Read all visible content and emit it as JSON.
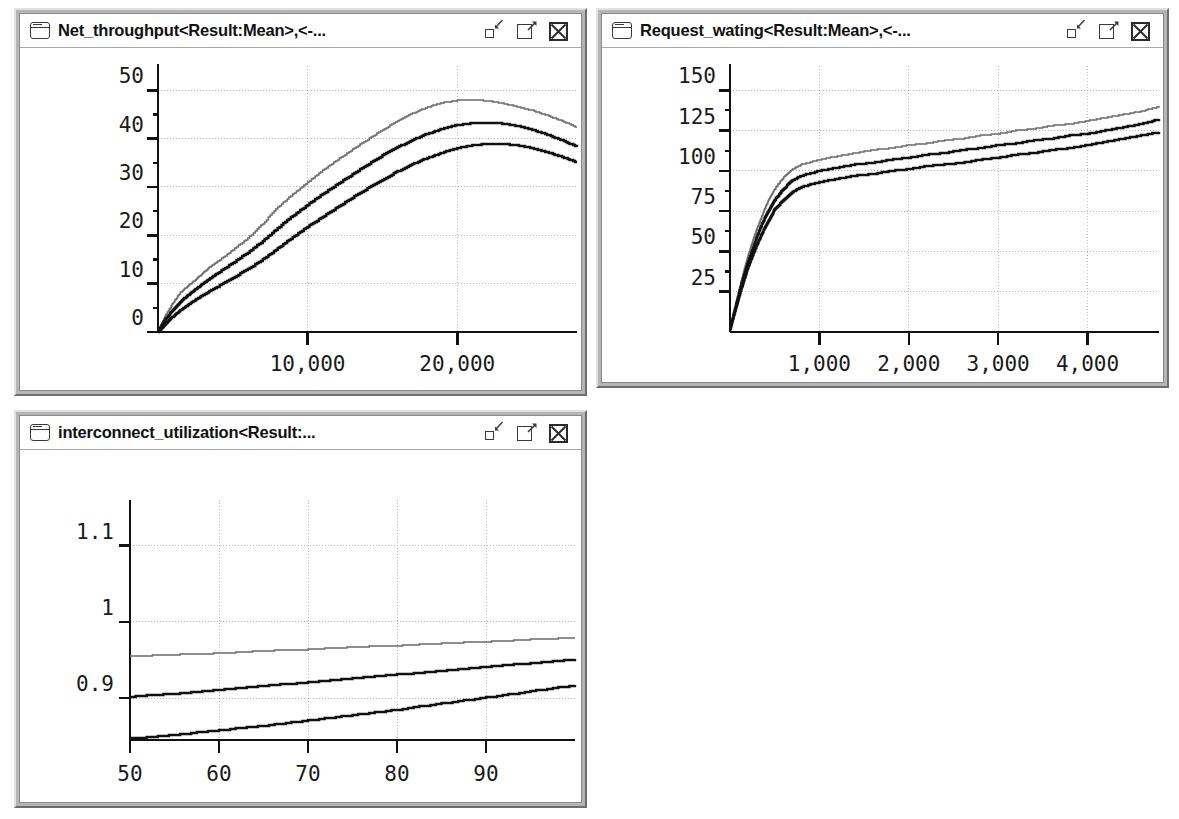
{
  "windows": [
    {
      "title": "Net_throughput<Result:Mean>,<-...",
      "icon": "window-icon",
      "buttons": [
        "minimize-icon",
        "maximize-icon",
        "close-icon"
      ]
    },
    {
      "title": "Request_wating<Result:Mean>,<-...",
      "icon": "window-icon",
      "buttons": [
        "minimize-icon",
        "maximize-icon",
        "close-icon"
      ]
    },
    {
      "title": "interconnect_utilization<Result:...",
      "icon": "window-icon",
      "buttons": [
        "minimize-icon",
        "maximize-icon",
        "close-icon"
      ]
    }
  ],
  "chart_data": [
    {
      "type": "line",
      "title": "Net_throughput<Result:Mean>,<-...",
      "xlabel": "",
      "ylabel": "",
      "grid": true,
      "legend": "none",
      "xlim": [
        0,
        28000
      ],
      "ylim": [
        0,
        55
      ],
      "xticks": [
        10000,
        20000
      ],
      "xticklabels": [
        "10,000",
        "20,000"
      ],
      "yticks": [
        0,
        10,
        20,
        30,
        40,
        50
      ],
      "yticklabels": [
        "0",
        "10",
        "20",
        "30",
        "40",
        "50"
      ],
      "x": [
        0,
        500,
        1000,
        1500,
        2000,
        2500,
        3000,
        3500,
        4000,
        5000,
        6000,
        7000,
        8000,
        9000,
        10000,
        11000,
        12000,
        13000,
        14000,
        15000,
        16000,
        17000,
        18000,
        19000,
        20000,
        21000,
        22000,
        23000,
        24000,
        25000,
        26000,
        27000,
        28000
      ],
      "series": [
        {
          "name": "upper",
          "color": "#6a6a6a",
          "values": [
            0.3,
            3.5,
            6.0,
            8.2,
            9.5,
            10.8,
            12.2,
            13.5,
            14.6,
            17.0,
            19.4,
            22.4,
            25.8,
            28.5,
            31.0,
            33.4,
            35.6,
            37.8,
            39.8,
            41.8,
            43.6,
            45.2,
            46.5,
            47.4,
            47.9,
            48.0,
            47.8,
            47.3,
            46.6,
            45.8,
            44.8,
            43.6,
            42.3
          ]
        },
        {
          "name": "mean",
          "color": "#111111",
          "values": [
            0.2,
            2.6,
            4.6,
            6.3,
            7.6,
            8.8,
            10.0,
            11.1,
            12.2,
            14.3,
            16.4,
            18.8,
            21.5,
            24.0,
            26.3,
            28.5,
            30.6,
            32.6,
            34.6,
            36.5,
            38.2,
            39.7,
            41.0,
            42.0,
            42.8,
            43.2,
            43.3,
            43.1,
            42.6,
            41.8,
            40.8,
            39.6,
            38.3
          ]
        },
        {
          "name": "lower",
          "color": "#111111",
          "values": [
            0.1,
            1.7,
            3.2,
            4.5,
            5.6,
            6.6,
            7.6,
            8.5,
            9.4,
            11.2,
            13.0,
            15.0,
            17.3,
            19.6,
            21.8,
            23.8,
            25.8,
            27.8,
            29.7,
            31.5,
            33.2,
            34.7,
            36.0,
            37.1,
            38.0,
            38.6,
            38.9,
            38.9,
            38.6,
            38.0,
            37.2,
            36.2,
            35.1
          ]
        }
      ]
    },
    {
      "type": "line",
      "title": "Request_wating<Result:Mean>,<-...",
      "xlabel": "",
      "ylabel": "",
      "grid": true,
      "legend": "none",
      "xlim": [
        0,
        4800
      ],
      "ylim": [
        0,
        165
      ],
      "xticks": [
        1000,
        2000,
        3000,
        4000
      ],
      "xticklabels": [
        "1,000",
        "2,000",
        "3,000",
        "4,000"
      ],
      "yticks": [
        25,
        50,
        75,
        100,
        125,
        150
      ],
      "yticklabels": [
        "25",
        "50",
        "75",
        "100",
        "125",
        "150"
      ],
      "x": [
        0,
        50,
        100,
        150,
        200,
        250,
        300,
        350,
        400,
        450,
        500,
        600,
        700,
        800,
        1000,
        1200,
        1400,
        1600,
        1800,
        2000,
        2200,
        2400,
        2600,
        2800,
        3000,
        3200,
        3400,
        3600,
        3800,
        4000,
        4200,
        4400,
        4600,
        4800
      ],
      "series": [
        {
          "name": "upper",
          "color": "#6a6a6a",
          "values": [
            2,
            14,
            26,
            37,
            47,
            56,
            64,
            71,
            78,
            84,
            89,
            96,
            101,
            104,
            107,
            109,
            111,
            113,
            114,
            116,
            117,
            119,
            120,
            122,
            123,
            125,
            126,
            128,
            129,
            131,
            133,
            135,
            137,
            140
          ]
        },
        {
          "name": "mean",
          "color": "#111111",
          "values": [
            2,
            13,
            24,
            34,
            43,
            51,
            59,
            66,
            72,
            77,
            82,
            89,
            94,
            97,
            100,
            102,
            104,
            105,
            107,
            108,
            110,
            111,
            113,
            114,
            116,
            117,
            119,
            120,
            122,
            123,
            125,
            127,
            129,
            132
          ]
        },
        {
          "name": "lower",
          "color": "#111111",
          "values": [
            2,
            12,
            22,
            31,
            40,
            47,
            54,
            60,
            66,
            71,
            76,
            82,
            87,
            90,
            93,
            95,
            97,
            98,
            100,
            101,
            103,
            104,
            105,
            107,
            108,
            110,
            111,
            113,
            114,
            116,
            118,
            120,
            122,
            124
          ]
        }
      ]
    },
    {
      "type": "line",
      "title": "interconnect_utilization<Result:...",
      "xlabel": "",
      "ylabel": "",
      "grid": true,
      "legend": "none",
      "xlim": [
        50,
        100
      ],
      "ylim": [
        0.845,
        1.16
      ],
      "xticks": [
        50,
        60,
        70,
        80,
        90
      ],
      "xticklabels": [
        "50",
        "60",
        "70",
        "80",
        "90"
      ],
      "yticks": [
        0.9,
        1,
        1.1
      ],
      "yticklabels": [
        "0.9",
        "1",
        "1.1"
      ],
      "x": [
        50,
        55,
        60,
        65,
        70,
        75,
        80,
        85,
        90,
        95,
        100
      ],
      "series": [
        {
          "name": "upper",
          "color": "#6a6a6a",
          "values": [
            0.955,
            0.957,
            0.959,
            0.962,
            0.964,
            0.967,
            0.969,
            0.972,
            0.974,
            0.977,
            0.979
          ]
        },
        {
          "name": "mean",
          "color": "#111111",
          "values": [
            0.902,
            0.906,
            0.911,
            0.916,
            0.921,
            0.926,
            0.931,
            0.936,
            0.941,
            0.946,
            0.951
          ]
        },
        {
          "name": "lower",
          "color": "#111111",
          "values": [
            0.847,
            0.852,
            0.858,
            0.864,
            0.871,
            0.878,
            0.885,
            0.893,
            0.901,
            0.909,
            0.917
          ]
        }
      ]
    }
  ],
  "colors": {
    "window_frame": "#b5b5b5",
    "plot_background": "#ffffff",
    "axis": "#111111",
    "grid": "#b9b9c6",
    "curve_dark": "#111111",
    "curve_light": "#6a6a6a"
  }
}
